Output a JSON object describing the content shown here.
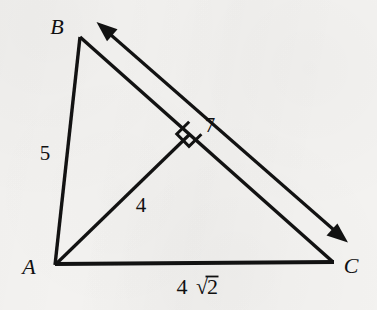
{
  "figure": {
    "kind": "geometry-diagram",
    "background_color": "#f3f2f0",
    "ink_color": "#121212",
    "vertices": [
      {
        "name": "A",
        "label": "A",
        "x": 55,
        "y": 265,
        "label_x": 30,
        "label_y": 273
      },
      {
        "name": "B",
        "label": "B",
        "x": 80,
        "y": 37,
        "label_x": 55,
        "label_y": 28
      },
      {
        "name": "C",
        "label": "C",
        "x": 333,
        "y": 262,
        "label_x": 345,
        "label_y": 272
      }
    ],
    "segments": [
      {
        "name": "side-AB",
        "from": "A",
        "to": "B",
        "x1": 55,
        "y1": 265,
        "x2": 80,
        "y2": 37,
        "width": 3.4
      },
      {
        "name": "side-AC",
        "from": "A",
        "to": "C",
        "x1": 55,
        "y1": 265,
        "x2": 333,
        "y2": 262,
        "width": 4.0
      },
      {
        "name": "side-BC",
        "from": "B",
        "to": "C",
        "x1": 80,
        "y1": 37,
        "x2": 333,
        "y2": 262,
        "width": 3.4
      },
      {
        "name": "altitude-A-to-BC",
        "from": "A",
        "to": "foot",
        "x1": 55,
        "y1": 265,
        "x2": 189,
        "y2": 133,
        "width": 3.2
      }
    ],
    "right_angle_marker": {
      "name": "right-angle-square",
      "at_x": 189,
      "at_y": 133,
      "size": 19,
      "width": 3.0
    },
    "dimension_arrow": {
      "name": "length-arrow-BC",
      "x1": 97,
      "y1": 23,
      "x2": 347,
      "y2": 241,
      "width": 3.2,
      "head_length": 19,
      "head_width": 13,
      "double_headed": true
    },
    "labels": [
      {
        "name": "label-side-AB",
        "text": "5",
        "x": 45,
        "y": 158,
        "style": "measure"
      },
      {
        "name": "label-altitude",
        "text": "4",
        "x": 140,
        "y": 211,
        "style": "measure"
      },
      {
        "name": "label-arrow-BC",
        "text": "7",
        "x": 208,
        "y": 130,
        "style": "measure"
      },
      {
        "name": "label-side-AC",
        "text": "4√2",
        "x": 170,
        "y": 292,
        "style": "radical"
      }
    ],
    "side_lengths": {
      "AB": "5",
      "AC": "4√2",
      "BC": "7",
      "altitude_from_A": "4"
    }
  }
}
